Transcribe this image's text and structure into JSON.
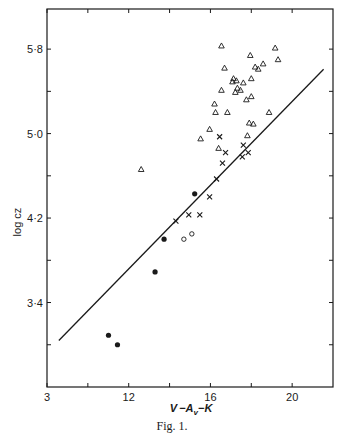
{
  "figure": {
    "caption": "Fig. 1."
  },
  "chart_data": {
    "type": "scatter",
    "title": "",
    "xlabel": "V −A",
    "xlabel_sub": "v",
    "xlabel_tail": "−K",
    "ylabel": "log cz",
    "xlim": [
      8,
      22
    ],
    "ylim": [
      2.6,
      6.18
    ],
    "x_major_ticks": [
      8,
      12,
      16,
      20
    ],
    "x_tick_labels": [
      "3",
      "12",
      "16",
      "20"
    ],
    "x_minor_ticks": [
      10,
      14,
      18
    ],
    "y_major_ticks": [
      3.4,
      4.2,
      5.0,
      5.8
    ],
    "y_tick_labels": [
      "3·4",
      "4·2",
      "5·0",
      "5·8"
    ],
    "y_minor_ticks": [
      3.0,
      3.8,
      4.6,
      5.4
    ],
    "grid": false,
    "legend": null,
    "colors": {
      "ink": "#1a1a1a",
      "background": "#ffffff"
    },
    "fit_line": {
      "x": [
        8.58,
        21.54
      ],
      "y": [
        3.04,
        5.61
      ]
    },
    "series": [
      {
        "name": "triangles",
        "marker": "open-triangle",
        "points": [
          [
            12.61,
            4.66
          ],
          [
            16.54,
            5.83
          ],
          [
            19.17,
            5.81
          ],
          [
            17.95,
            5.74
          ],
          [
            19.31,
            5.7
          ],
          [
            16.69,
            5.62
          ],
          [
            18.19,
            5.63
          ],
          [
            18.34,
            5.61
          ],
          [
            18.58,
            5.66
          ],
          [
            17.13,
            5.52
          ],
          [
            17.27,
            5.5
          ],
          [
            17.08,
            5.49
          ],
          [
            17.61,
            5.48
          ],
          [
            18.0,
            5.52
          ],
          [
            17.32,
            5.43
          ],
          [
            17.47,
            5.41
          ],
          [
            17.22,
            5.39
          ],
          [
            16.54,
            5.41
          ],
          [
            17.76,
            5.32
          ],
          [
            18.0,
            5.35
          ],
          [
            16.2,
            5.28
          ],
          [
            16.25,
            5.2
          ],
          [
            16.83,
            5.2
          ],
          [
            18.87,
            5.2
          ],
          [
            17.9,
            5.1
          ],
          [
            18.1,
            5.09
          ],
          [
            15.96,
            5.04
          ],
          [
            15.52,
            4.95
          ],
          [
            17.81,
            4.98
          ],
          [
            16.4,
            4.86
          ]
        ]
      },
      {
        "name": "crosses",
        "marker": "cross",
        "points": [
          [
            16.45,
            4.97
          ],
          [
            17.61,
            4.89
          ],
          [
            16.74,
            4.82
          ],
          [
            17.85,
            4.82
          ],
          [
            17.56,
            4.78
          ],
          [
            16.59,
            4.72
          ],
          [
            16.3,
            4.57
          ],
          [
            15.96,
            4.4
          ],
          [
            15.48,
            4.23
          ],
          [
            14.94,
            4.23
          ],
          [
            14.31,
            4.17
          ]
        ]
      },
      {
        "name": "filled-circles",
        "marker": "filled-circle",
        "points": [
          [
            15.23,
            4.43
          ],
          [
            13.73,
            4.0
          ],
          [
            13.29,
            3.69
          ],
          [
            11.01,
            3.09
          ],
          [
            11.45,
            3.0
          ]
        ]
      },
      {
        "name": "open-circles",
        "marker": "open-circle",
        "points": [
          [
            14.7,
            4.0
          ],
          [
            15.09,
            4.05
          ]
        ]
      }
    ]
  }
}
